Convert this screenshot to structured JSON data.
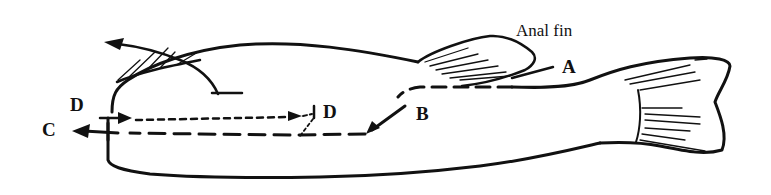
{
  "figure": {
    "labels": {
      "anal_fin": "Anal fin",
      "A": "A",
      "B": "B",
      "C": "C",
      "D_left": "D",
      "D_right": "D"
    },
    "paths": [
      {
        "id": "A",
        "style": "solid short line",
        "description": "line from anal fin region"
      },
      {
        "id": "B",
        "style": "dashed with arrow",
        "description": "dashed cut from anal fin area curving toward head"
      },
      {
        "id": "C",
        "style": "dashed with arrow",
        "description": "long dashed cut to the head end, arrow exiting left"
      },
      {
        "id": "D",
        "style": "dotted with arrow",
        "description": "dotted cut between the two D marks"
      }
    ],
    "ink_color": "#111111",
    "background": "#ffffff"
  }
}
